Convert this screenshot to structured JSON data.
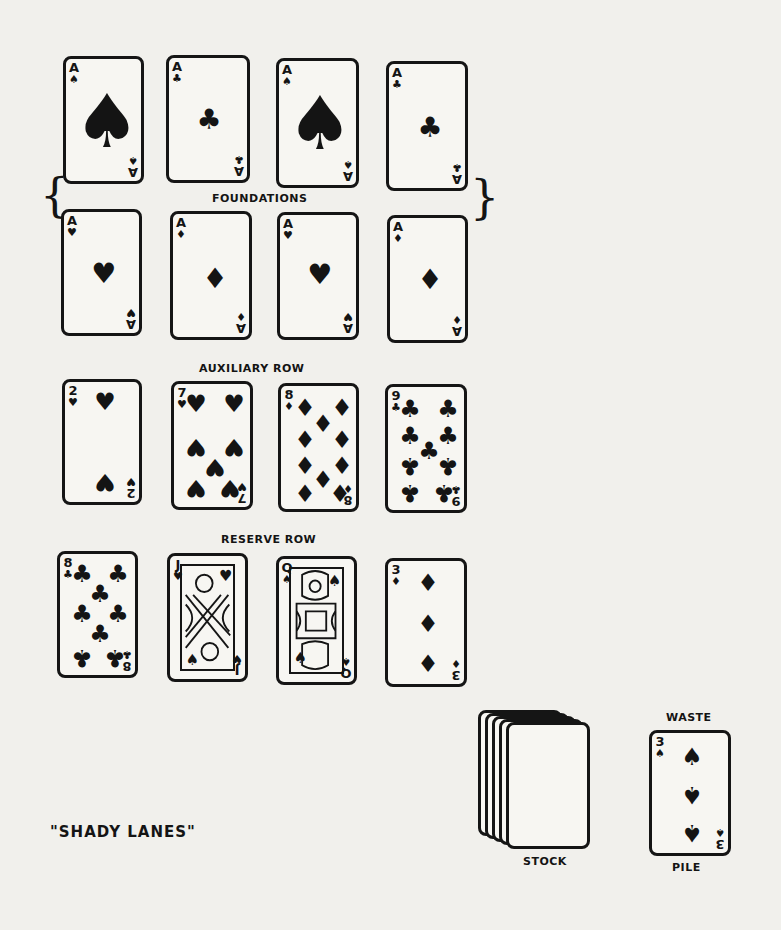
{
  "title": "\"SHADY LANES\"",
  "labels": {
    "foundations": "FOUNDATIONS",
    "auxiliary": "AUXILIARY ROW",
    "reserve": "RESERVE ROW",
    "stock": "STOCK",
    "waste_top": "WASTE",
    "waste_bottom": "PILE"
  },
  "foundations_top": [
    {
      "rank": "A",
      "suit": "♠",
      "suit_name": "spades"
    },
    {
      "rank": "A",
      "suit": "♣",
      "suit_name": "clubs"
    },
    {
      "rank": "A",
      "suit": "♠",
      "suit_name": "spades"
    },
    {
      "rank": "A",
      "suit": "♣",
      "suit_name": "clubs"
    }
  ],
  "foundations_bottom": [
    {
      "rank": "A",
      "suit": "♥",
      "suit_name": "hearts"
    },
    {
      "rank": "A",
      "suit": "♦",
      "suit_name": "diamonds"
    },
    {
      "rank": "A",
      "suit": "♥",
      "suit_name": "hearts"
    },
    {
      "rank": "A",
      "suit": "♦",
      "suit_name": "diamonds"
    }
  ],
  "auxiliary_row": [
    {
      "rank": "2",
      "suit": "♥",
      "suit_name": "hearts"
    },
    {
      "rank": "7",
      "suit": "♥",
      "suit_name": "hearts"
    },
    {
      "rank": "8",
      "suit": "♦",
      "suit_name": "diamonds"
    },
    {
      "rank": "9",
      "suit": "♣",
      "suit_name": "clubs"
    }
  ],
  "reserve_row": [
    {
      "rank": "8",
      "suit": "♣",
      "suit_name": "clubs"
    },
    {
      "rank": "J",
      "suit": "♥",
      "suit_name": "hearts"
    },
    {
      "rank": "Q",
      "suit": "♠",
      "suit_name": "spades"
    },
    {
      "rank": "3",
      "suit": "♦",
      "suit_name": "diamonds"
    }
  ],
  "waste_pile": {
    "rank": "3",
    "suit": "♠",
    "suit_name": "spades"
  },
  "stock": {
    "card_count_shown": 5
  }
}
